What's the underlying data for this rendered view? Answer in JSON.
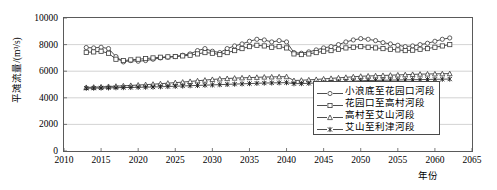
{
  "chart_data": {
    "type": "line",
    "title": "",
    "xlabel": "年份",
    "ylabel": "平滩流量/(m³/s)",
    "xlim": [
      2010,
      2065
    ],
    "ylim": [
      0,
      10000
    ],
    "xticks": [
      2010,
      2015,
      2020,
      2025,
      2030,
      2035,
      2040,
      2045,
      2050,
      2055,
      2060,
      2065
    ],
    "yticks": [
      0,
      2000,
      4000,
      6000,
      8000,
      10000
    ],
    "grid": "horizontal",
    "legend_position": "lower-right-inside",
    "x": [
      2013,
      2014,
      2015,
      2016,
      2017,
      2018,
      2019,
      2020,
      2021,
      2022,
      2023,
      2024,
      2025,
      2026,
      2027,
      2028,
      2029,
      2030,
      2031,
      2032,
      2033,
      2034,
      2035,
      2036,
      2037,
      2038,
      2039,
      2040,
      2041,
      2042,
      2043,
      2044,
      2045,
      2046,
      2047,
      2048,
      2049,
      2050,
      2051,
      2052,
      2053,
      2054,
      2055,
      2056,
      2057,
      2058,
      2059,
      2060,
      2061,
      2062
    ],
    "series": [
      {
        "name": "小浪底至花园口河段",
        "marker": "circle",
        "values": [
          7780,
          7750,
          7800,
          7700,
          7100,
          6700,
          6800,
          6750,
          6800,
          6900,
          7000,
          7050,
          7100,
          7200,
          7300,
          7550,
          7700,
          7500,
          7400,
          7700,
          7900,
          8050,
          8250,
          8400,
          8350,
          8200,
          8300,
          8200,
          7400,
          7350,
          7450,
          7600,
          7750,
          7850,
          8000,
          8200,
          8350,
          8450,
          8400,
          8300,
          8150,
          8050,
          7950,
          7850,
          7900,
          8000,
          8100,
          8250,
          8400,
          8500
        ]
      },
      {
        "name": "花园口至高村河段",
        "marker": "square",
        "values": [
          7420,
          7450,
          7500,
          7350,
          6900,
          6800,
          6850,
          6900,
          6950,
          7000,
          7050,
          7080,
          7100,
          7150,
          7200,
          7300,
          7400,
          7350,
          7250,
          7400,
          7550,
          7700,
          7850,
          7950,
          7900,
          7800,
          7850,
          7750,
          7300,
          7250,
          7300,
          7400,
          7500,
          7550,
          7650,
          7750,
          7800,
          7850,
          7800,
          7750,
          7700,
          7650,
          7600,
          7550,
          7580,
          7650,
          7700,
          7800,
          7900,
          8000
        ]
      },
      {
        "name": "高村至艾山河段",
        "marker": "triangle",
        "values": [
          4780,
          4800,
          4820,
          4850,
          4870,
          4900,
          4930,
          4960,
          4990,
          5020,
          5060,
          5100,
          5140,
          5180,
          5230,
          5280,
          5330,
          5380,
          5420,
          5450,
          5480,
          5500,
          5520,
          5540,
          5560,
          5570,
          5580,
          5590,
          5300,
          5320,
          5350,
          5380,
          5420,
          5460,
          5500,
          5540,
          5580,
          5620,
          5640,
          5660,
          5680,
          5700,
          5720,
          5740,
          5760,
          5780,
          5790,
          5800,
          5810,
          5820
        ]
      },
      {
        "name": "艾山至利津河段",
        "marker": "xstar",
        "values": [
          4720,
          4730,
          4740,
          4750,
          4760,
          4770,
          4780,
          4790,
          4800,
          4810,
          4830,
          4850,
          4870,
          4890,
          4910,
          4930,
          4950,
          4970,
          4990,
          5010,
          5030,
          5050,
          5070,
          5090,
          5110,
          5120,
          5130,
          5140,
          5060,
          5070,
          5090,
          5110,
          5130,
          5160,
          5190,
          5220,
          5250,
          5280,
          5300,
          5310,
          5320,
          5330,
          5340,
          5350,
          5360,
          5370,
          5380,
          5390,
          5400,
          5410
        ]
      }
    ],
    "colors": {
      "series_line": "#3a3a3a",
      "grid": "#c8c8c8",
      "frame": "#5a5a5a",
      "background": "#ffffff"
    }
  }
}
